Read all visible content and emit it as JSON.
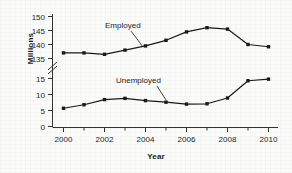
{
  "chart_data": {
    "type": "line",
    "title": "",
    "xlabel": "Year",
    "ylabel": "Millions",
    "x": [
      2000,
      2001,
      2002,
      2003,
      2004,
      2005,
      2006,
      2007,
      2008,
      2009,
      2010
    ],
    "xtick_labels": [
      "2000",
      "2002",
      "2004",
      "2006",
      "2008",
      "2010"
    ],
    "xtick_values": [
      2000,
      2002,
      2004,
      2006,
      2008,
      2010
    ],
    "xminor_values": [
      2001,
      2003,
      2005,
      2007,
      2009
    ],
    "xlim": [
      2000,
      2010
    ],
    "ytick_labels_upper": [
      "150",
      "145",
      "140",
      "135"
    ],
    "ytick_values_upper": [
      150,
      145,
      140,
      135
    ],
    "ytick_labels_lower": [
      "15",
      "10",
      "5",
      "0"
    ],
    "ytick_values_lower": [
      15,
      10,
      5,
      0
    ],
    "axis_break": true,
    "axis_break_between": [
      15,
      135
    ],
    "ylim_upper": [
      135,
      150
    ],
    "ylim_lower": [
      0,
      15
    ],
    "grid": false,
    "legend_position": "inline-annotations",
    "marker": "square-filled",
    "line_color": "#1a1a1a",
    "series": [
      {
        "name": "Employed",
        "label": "Employed",
        "values": [
          137.0,
          137.0,
          136.5,
          138.0,
          139.5,
          141.5,
          144.5,
          146.0,
          145.5,
          140.0,
          139.2
        ]
      },
      {
        "name": "Unemployed",
        "label": "Unemployed",
        "values": [
          5.7,
          6.8,
          8.4,
          8.8,
          8.1,
          7.6,
          7.0,
          7.1,
          8.9,
          14.3,
          14.8
        ]
      }
    ],
    "annotations": [
      {
        "text": "Employed",
        "series": "Employed"
      },
      {
        "text": "Unemployed",
        "series": "Unemployed"
      }
    ]
  }
}
